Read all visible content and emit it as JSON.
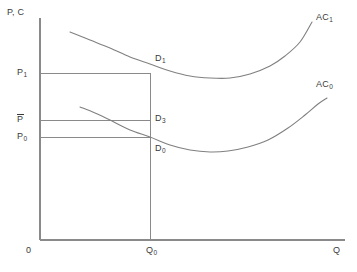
{
  "chart_data": {
    "type": "line",
    "title": "",
    "xlabel": "Q",
    "ylabel": "P, C",
    "grid": false,
    "legend": "inline-curve-labels",
    "axes": {
      "x_axis_label": "Q",
      "y_axis_label": "P, C",
      "origin_label": "0",
      "x_ticks": [
        "Q₀"
      ],
      "y_ticks": [
        "P₁",
        "P̄",
        "P₀"
      ]
    },
    "series": [
      {
        "name": "AC₁",
        "label": "AC",
        "label_sub": "1",
        "shape": "u-shaped average cost curve (upper)",
        "points": [
          [
            70,
            32
          ],
          [
            90,
            40
          ],
          [
            110,
            48
          ],
          [
            130,
            57
          ],
          [
            150,
            64
          ],
          [
            170,
            71
          ],
          [
            190,
            76
          ],
          [
            210,
            78
          ],
          [
            230,
            78
          ],
          [
            250,
            74
          ],
          [
            270,
            66
          ],
          [
            285,
            56
          ],
          [
            300,
            42
          ],
          [
            312,
            22
          ]
        ]
      },
      {
        "name": "AC₀",
        "label": "AC",
        "label_sub": "0",
        "shape": "u-shaped average cost curve (lower)",
        "points": [
          [
            80,
            107
          ],
          [
            95,
            113
          ],
          [
            112,
            121
          ],
          [
            130,
            130
          ],
          [
            150,
            137
          ],
          [
            170,
            145
          ],
          [
            190,
            150
          ],
          [
            210,
            152
          ],
          [
            228,
            151
          ],
          [
            248,
            147
          ],
          [
            268,
            140
          ],
          [
            288,
            128
          ],
          [
            305,
            115
          ],
          [
            318,
            104
          ],
          [
            327,
            98
          ]
        ]
      }
    ],
    "points_of_interest": [
      {
        "name": "D₁",
        "label": "D",
        "sub": "1",
        "x": 150,
        "y": 73,
        "note": "tangency of AC₁ with P₁ at Q₀"
      },
      {
        "name": "D₃",
        "label": "D",
        "sub": "3",
        "x": 150,
        "y": 120,
        "note": "point at P̄ and Q₀"
      },
      {
        "name": "D₀",
        "label": "D",
        "sub": "0",
        "x": 150,
        "y": 137,
        "note": "tangency of AC₀ with P₀ at Q₀"
      }
    ],
    "reference_lines": {
      "vertical": [
        {
          "label": "Q₀",
          "x": 150,
          "from_y": 240,
          "to_y": 73
        }
      ],
      "horizontal": [
        {
          "label": "P₁",
          "y": 73,
          "from_x": 40,
          "to_x": 150
        },
        {
          "label": "P̄",
          "y": 120,
          "from_x": 40,
          "to_x": 150
        },
        {
          "label": "P₀",
          "y": 137,
          "from_x": 40,
          "to_x": 150
        }
      ]
    },
    "colors": {
      "line": "#808080",
      "axis": "#8a8a8a",
      "text": "#3a3a3a",
      "background": "#ffffff"
    }
  },
  "axes": {
    "y_label": "P, C",
    "x_label": "Q",
    "origin": "0"
  },
  "ticks": {
    "x": {
      "q0_main": "Q",
      "q0_sub": "0"
    },
    "y": {
      "p1_main": "P",
      "p1_sub": "1",
      "pbar_main": "P",
      "p0_main": "P",
      "p0_sub": "0"
    }
  },
  "points": {
    "d1_main": "D",
    "d1_sub": "1",
    "d3_main": "D",
    "d3_sub": "3",
    "d0_main": "D",
    "d0_sub": "0"
  },
  "curves": {
    "ac1_main": "AC",
    "ac1_sub": "1",
    "ac0_main": "AC",
    "ac0_sub": "0"
  }
}
